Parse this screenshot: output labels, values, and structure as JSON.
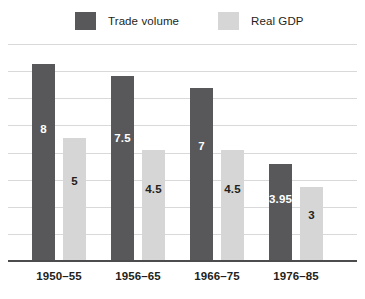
{
  "chart_data": {
    "type": "bar",
    "title": "",
    "subtitle": "",
    "xlabel": "",
    "ylabel": "",
    "grid": true,
    "legend_position": "top",
    "categories": [
      "1950–55",
      "1956–65",
      "1966–75",
      "1976–85"
    ],
    "ylim": [
      0,
      8.8
    ],
    "series": [
      {
        "name": "Trade volume",
        "color": "#58585b",
        "label_color": "#ffffff",
        "values": [
          8,
          7.5,
          7,
          3.95
        ],
        "value_labels": [
          "8",
          "7.5",
          "7",
          "3.95"
        ]
      },
      {
        "name": "Real GDP",
        "color": "#d6d6d6",
        "label_color": "#231f20",
        "values": [
          5,
          4.5,
          4.5,
          3
        ],
        "value_labels": [
          "5",
          "4.5",
          "4.5",
          "3"
        ]
      }
    ]
  },
  "legend": {
    "items": [
      {
        "label": "Trade volume",
        "color": "#58585b"
      },
      {
        "label": "Real GDP",
        "color": "#d6d6d6"
      }
    ]
  },
  "axis": {
    "line_color": "#4c4c4e",
    "gridline_color": "#d9d9d9",
    "gridline_count": 8
  }
}
